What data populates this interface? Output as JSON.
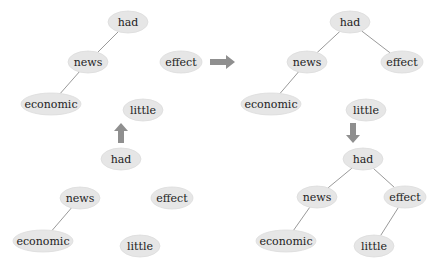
{
  "diagram": {
    "title": "",
    "colors": {
      "node_fill": "#e6e6e6",
      "edge": "#9a9a9a",
      "arrow": "#8f8f8f",
      "text": "#222222"
    },
    "panels": [
      {
        "id": "top-left",
        "nodes": [
          {
            "id": "had",
            "label": "had",
            "cx": 128,
            "cy": 22,
            "rx": 20,
            "ry": 11
          },
          {
            "id": "news",
            "label": "news",
            "cx": 88,
            "cy": 62,
            "rx": 20,
            "ry": 11
          },
          {
            "id": "economic",
            "label": "economic",
            "cx": 51,
            "cy": 104,
            "rx": 30,
            "ry": 11
          },
          {
            "id": "effect",
            "label": "effect",
            "cx": 181,
            "cy": 62,
            "rx": 21,
            "ry": 11
          },
          {
            "id": "little",
            "label": "little",
            "cx": 143,
            "cy": 110,
            "rx": 20,
            "ry": 11
          }
        ],
        "edges": [
          [
            "had",
            "news"
          ],
          [
            "news",
            "economic"
          ]
        ]
      },
      {
        "id": "bottom-left",
        "nodes": [
          {
            "id": "had",
            "label": "had",
            "cx": 121,
            "cy": 159,
            "rx": 20,
            "ry": 11
          },
          {
            "id": "news",
            "label": "news",
            "cx": 80,
            "cy": 198,
            "rx": 20,
            "ry": 11
          },
          {
            "id": "economic",
            "label": "economic",
            "cx": 43,
            "cy": 241,
            "rx": 30,
            "ry": 11
          },
          {
            "id": "effect",
            "label": "effect",
            "cx": 172,
            "cy": 198,
            "rx": 21,
            "ry": 11
          },
          {
            "id": "little",
            "label": "little",
            "cx": 140,
            "cy": 246,
            "rx": 20,
            "ry": 11
          }
        ],
        "edges": [
          [
            "news",
            "economic"
          ]
        ]
      },
      {
        "id": "top-right",
        "nodes": [
          {
            "id": "had",
            "label": "had",
            "cx": 350,
            "cy": 22,
            "rx": 20,
            "ry": 11
          },
          {
            "id": "news",
            "label": "news",
            "cx": 307,
            "cy": 62,
            "rx": 20,
            "ry": 11
          },
          {
            "id": "economic",
            "label": "economic",
            "cx": 271,
            "cy": 104,
            "rx": 30,
            "ry": 11
          },
          {
            "id": "effect",
            "label": "effect",
            "cx": 402,
            "cy": 62,
            "rx": 21,
            "ry": 11
          },
          {
            "id": "little",
            "label": "little",
            "cx": 366,
            "cy": 110,
            "rx": 20,
            "ry": 11
          }
        ],
        "edges": [
          [
            "had",
            "news"
          ],
          [
            "news",
            "economic"
          ],
          [
            "had",
            "effect"
          ]
        ]
      },
      {
        "id": "bottom-right",
        "nodes": [
          {
            "id": "had",
            "label": "had",
            "cx": 363,
            "cy": 159,
            "rx": 20,
            "ry": 11
          },
          {
            "id": "news",
            "label": "news",
            "cx": 317,
            "cy": 197,
            "rx": 20,
            "ry": 11
          },
          {
            "id": "economic",
            "label": "economic",
            "cx": 286,
            "cy": 241,
            "rx": 30,
            "ry": 11
          },
          {
            "id": "effect",
            "label": "effect",
            "cx": 405,
            "cy": 197,
            "rx": 21,
            "ry": 11
          },
          {
            "id": "little",
            "label": "little",
            "cx": 374,
            "cy": 246,
            "rx": 20,
            "ry": 11
          }
        ],
        "edges": [
          [
            "had",
            "news"
          ],
          [
            "news",
            "economic"
          ],
          [
            "had",
            "effect"
          ],
          [
            "effect",
            "little"
          ]
        ]
      }
    ],
    "arrows": [
      {
        "id": "arrow-up",
        "direction": "up",
        "x": 121,
        "y": 133
      },
      {
        "id": "arrow-right",
        "direction": "right",
        "x": 223,
        "y": 62
      },
      {
        "id": "arrow-down",
        "direction": "down",
        "x": 353,
        "y": 133
      }
    ]
  }
}
